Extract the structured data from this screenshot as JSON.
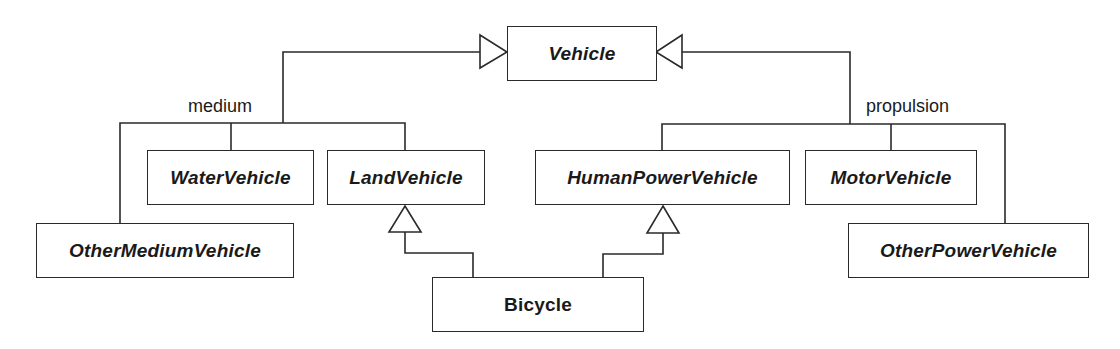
{
  "diagram": {
    "type": "UML class diagram (generalization hierarchy)",
    "root": {
      "id": "vehicle",
      "name": "Vehicle",
      "abstract": true,
      "box": {
        "x": 507,
        "y": 26,
        "w": 150,
        "h": 55
      }
    },
    "discriminators": {
      "medium": {
        "label": "medium",
        "x": 188,
        "y": 96
      },
      "propulsion": {
        "label": "propulsion",
        "x": 866,
        "y": 96
      }
    },
    "classes": [
      {
        "id": "water",
        "name": "WaterVehicle",
        "abstract": true,
        "parent": "vehicle",
        "discriminator": "medium",
        "box": {
          "x": 147,
          "y": 150,
          "w": 167,
          "h": 55
        }
      },
      {
        "id": "land",
        "name": "LandVehicle",
        "abstract": true,
        "parent": "vehicle",
        "discriminator": "medium",
        "box": {
          "x": 327,
          "y": 150,
          "w": 158,
          "h": 55
        }
      },
      {
        "id": "othermedium",
        "name": "OtherMediumVehicle",
        "abstract": true,
        "parent": "vehicle",
        "discriminator": "medium",
        "box": {
          "x": 36,
          "y": 223,
          "w": 258,
          "h": 55
        }
      },
      {
        "id": "human",
        "name": "HumanPowerVehicle",
        "abstract": true,
        "parent": "vehicle",
        "discriminator": "propulsion",
        "box": {
          "x": 535,
          "y": 150,
          "w": 255,
          "h": 55
        }
      },
      {
        "id": "motor",
        "name": "MotorVehicle",
        "abstract": true,
        "parent": "vehicle",
        "discriminator": "propulsion",
        "box": {
          "x": 805,
          "y": 150,
          "w": 172,
          "h": 55
        }
      },
      {
        "id": "otherpower",
        "name": "OtherPowerVehicle",
        "abstract": true,
        "parent": "vehicle",
        "discriminator": "propulsion",
        "box": {
          "x": 848,
          "y": 223,
          "w": 241,
          "h": 55
        }
      },
      {
        "id": "bicycle",
        "name": "Bicycle",
        "abstract": false,
        "parents": [
          "land",
          "human"
        ],
        "box": {
          "x": 432,
          "y": 277,
          "w": 212,
          "h": 55
        }
      }
    ],
    "colors": {
      "line": "#2a2a2a",
      "box_fill": "#ffffff",
      "text": "#1a1a1a",
      "background": "#ffffff"
    }
  }
}
